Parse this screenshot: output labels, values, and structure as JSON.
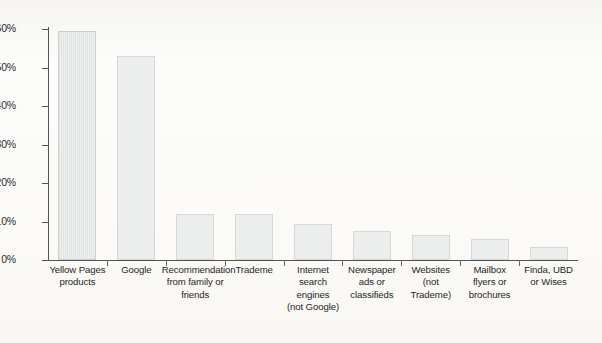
{
  "chart_data": {
    "type": "bar",
    "title": "",
    "subtitle": "",
    "xlabel": "",
    "ylabel": "",
    "ylim": [
      0,
      60
    ],
    "grid": false,
    "legend": "none",
    "value_suffix": "%",
    "categories": [
      "Yellow Pages products",
      "Google",
      "Recommendation from family or friends",
      "Trademe",
      "Internet search engines (not Google)",
      "Newspaper ads or classifieds",
      "Websites (not Trademe)",
      "Mailbox flyers or brochures",
      "Finda, UBD or Wises"
    ],
    "category_lines": [
      [
        "Yellow Pages",
        "products"
      ],
      [
        "Google"
      ],
      [
        "Recommendation",
        "from family or",
        "friends"
      ],
      [
        "Trademe"
      ],
      [
        "Internet",
        "search",
        "engines",
        "(not Google)"
      ],
      [
        "Newspaper",
        "ads or",
        "classifieds"
      ],
      [
        "Websites",
        "(not",
        "Trademe)"
      ],
      [
        "Mailbox",
        "flyers or",
        "brochures"
      ],
      [
        "Finda, UBD",
        "or Wises"
      ]
    ],
    "values": [
      59.5,
      53,
      12,
      12,
      9.3,
      7.5,
      6.5,
      5.5,
      3.4
    ],
    "ticks": [
      {
        "value": 60,
        "label": "60%"
      },
      {
        "value": 50,
        "label": "50%"
      },
      {
        "value": 40,
        "label": "40%"
      },
      {
        "value": 30,
        "label": "30%"
      },
      {
        "value": 20,
        "label": "20%"
      },
      {
        "value": 10,
        "label": "10%"
      },
      {
        "value": 0,
        "label": "0%"
      }
    ],
    "colors": {
      "background": "#fbfaf8",
      "bar_fill": "#eceeee",
      "bar_fill_highlight": "#e6e8e8",
      "bar_border": "#d6d8d8",
      "axis": "#555350",
      "text": "#1f1f1f"
    },
    "highlight_index": 0
  }
}
